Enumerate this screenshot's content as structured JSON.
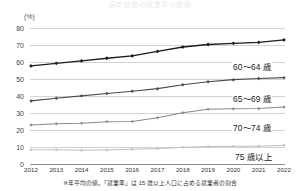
{
  "title": "高年齢者の就業率の推移",
  "axis": {
    "y_unit": "(%)",
    "y_ticks": [
      80,
      70,
      60,
      50,
      40,
      30,
      20,
      10,
      0
    ],
    "x_ticks": [
      "2012",
      "2013",
      "2014",
      "2015",
      "2016",
      "2017",
      "2018",
      "2019",
      "2020",
      "2021",
      "2022"
    ]
  },
  "footnote": "※年平均の値。「就業率」は 15 歳以上人口に占める就業者の割合",
  "series_labels": {
    "s1": "60～64 歳",
    "s2": "65～69 歳",
    "s3": "70～74 歳",
    "s4": "75 歳以上"
  },
  "colors": {
    "s1": "#1c1c1c",
    "s2": "#4a4a4a",
    "s3": "#8a8a8a",
    "s4": "#c0c0c0",
    "grid": "#d2d2d2",
    "axis": "#8e8e8e"
  },
  "chart_data": {
    "type": "line",
    "title": "高年齢者の就業率の推移",
    "xlabel": "",
    "ylabel": "(%)",
    "ylim": [
      0,
      80
    ],
    "grid": true,
    "legend": "inline-right",
    "x": [
      "2012",
      "2013",
      "2014",
      "2015",
      "2016",
      "2017",
      "2018",
      "2019",
      "2020",
      "2021",
      "2022"
    ],
    "series": [
      {
        "name": "60～64 歳",
        "values": [
          57.7,
          59.2,
          60.7,
          62.2,
          63.6,
          66.2,
          68.8,
          70.3,
          71.0,
          71.5,
          73.0
        ]
      },
      {
        "name": "65～69 歳",
        "values": [
          37.1,
          38.7,
          40.1,
          41.5,
          42.8,
          44.3,
          46.6,
          48.4,
          49.6,
          50.3,
          50.8
        ]
      },
      {
        "name": "70～74 歳",
        "values": [
          23.0,
          23.7,
          24.0,
          24.9,
          25.0,
          27.2,
          30.2,
          32.2,
          32.5,
          32.6,
          33.5
        ]
      },
      {
        "name": "75 歳以上",
        "values": [
          8.4,
          8.4,
          8.1,
          8.3,
          8.7,
          9.0,
          9.8,
          10.3,
          10.4,
          10.5,
          11.0
        ]
      }
    ]
  }
}
